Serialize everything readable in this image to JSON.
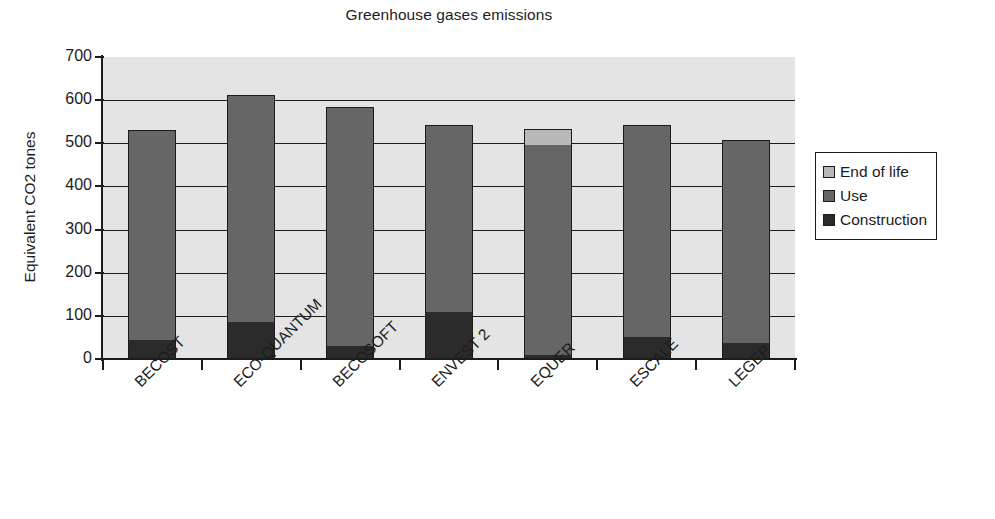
{
  "chart_data": {
    "type": "bar",
    "stacked": true,
    "title": "Greenhouse gases emissions",
    "xlabel": "",
    "ylabel": "Equivalent CO2 tones",
    "ylim": [
      0,
      700
    ],
    "ytick_step": 100,
    "yticks": [
      700,
      600,
      500,
      400,
      300,
      200,
      100,
      0
    ],
    "grid": true,
    "legend_position": "right",
    "categories": [
      "BECOST",
      "ECO-QUANTUM",
      "BECOSOFT",
      "ENVEST 2",
      "EQUER",
      "ESCALE",
      "LEGEP"
    ],
    "series": [
      {
        "name": "Construction",
        "color": "#2b2b2b",
        "values": [
          45,
          85,
          30,
          110,
          10,
          50,
          38
        ]
      },
      {
        "name": "Use",
        "color": "#666666",
        "values": [
          485,
          528,
          555,
          433,
          487,
          493,
          469
        ]
      },
      {
        "name": "End of life",
        "color": "#b9b9b9",
        "values": [
          0,
          0,
          0,
          0,
          36,
          0,
          0
        ]
      }
    ],
    "totals": [
      530,
      613,
      585,
      543,
      533,
      543,
      507
    ],
    "plot_background": "#e4e4e4",
    "axis_color": "#1b1b1b"
  },
  "legend": {
    "items": [
      {
        "label": "End of life",
        "color": "#b9b9b9"
      },
      {
        "label": "Use",
        "color": "#666666"
      },
      {
        "label": "Construction",
        "color": "#2b2b2b"
      }
    ]
  }
}
